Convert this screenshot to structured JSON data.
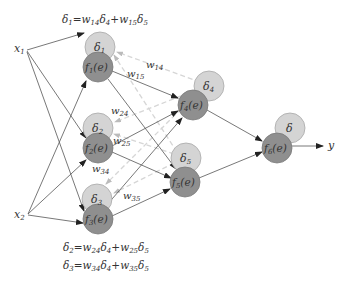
{
  "colors": {
    "delta_node_fill": "#d4d4d4",
    "delta_node_stroke": "#a8a8a8",
    "f_node_fill": "#8f8f8f",
    "f_node_stroke": "#7a7a7a",
    "forward_edge": "#555555",
    "backprop_edge": "#d6d6d6",
    "text": "#333333"
  },
  "inputs": [
    {
      "id": "x1",
      "label": "x",
      "sub": "1",
      "x": 22,
      "y": 49
    },
    {
      "id": "x2",
      "label": "x",
      "sub": "2",
      "x": 22,
      "y": 215
    }
  ],
  "output": {
    "label": "y",
    "x": 331,
    "y": 146
  },
  "nodes": [
    {
      "id": "n1",
      "delta": {
        "label": "δ",
        "sub": "1",
        "cx": 100,
        "cy": 47
      },
      "f": {
        "label": "f",
        "sub": "1",
        "arg": "(e)",
        "cx": 98,
        "cy": 67
      }
    },
    {
      "id": "n2",
      "delta": {
        "label": "δ",
        "sub": "2",
        "cx": 98,
        "cy": 128
      },
      "f": {
        "label": "f",
        "sub": "2",
        "arg": "(e)",
        "cx": 98,
        "cy": 148
      }
    },
    {
      "id": "n3",
      "delta": {
        "label": "δ",
        "sub": "3",
        "cx": 97,
        "cy": 199
      },
      "f": {
        "label": "f",
        "sub": "3",
        "arg": "(e)",
        "cx": 98,
        "cy": 219
      }
    },
    {
      "id": "n4",
      "delta": {
        "label": "δ",
        "sub": "4",
        "cx": 209,
        "cy": 86
      },
      "f": {
        "label": "f",
        "sub": "4",
        "arg": "(e)",
        "cx": 193,
        "cy": 105
      }
    },
    {
      "id": "n5",
      "delta": {
        "label": "δ",
        "sub": "5",
        "cx": 186,
        "cy": 157
      },
      "f": {
        "label": "f",
        "sub": "5",
        "arg": "(e)",
        "cx": 185,
        "cy": 182
      }
    },
    {
      "id": "n6",
      "delta": {
        "label": "δ",
        "sub": "",
        "cx": 290,
        "cy": 128
      },
      "f": {
        "label": "f",
        "sub": "6",
        "arg": "(e)",
        "cx": 277,
        "cy": 148
      }
    }
  ],
  "weights": [
    {
      "label": "w",
      "sub": "14",
      "x": 222,
      "y": 66
    },
    {
      "label": "w",
      "sub": "15",
      "x": 128,
      "y": 76
    },
    {
      "label": "w",
      "sub": "24",
      "x": 111,
      "y": 112
    },
    {
      "label": "w",
      "sub": "25",
      "x": 113,
      "y": 143
    },
    {
      "label": "w",
      "sub": "34",
      "x": 93,
      "y": 174
    },
    {
      "label": "w",
      "sub": "35",
      "x": 123,
      "y": 200
    }
  ],
  "formulas": {
    "top": {
      "lhs": "δ",
      "lhs_sub": "1",
      "t1_w": "w",
      "t1_w_sub": "14",
      "t1_d": "δ",
      "t1_d_sub": "4",
      "t2_w": "w",
      "t2_w_sub": "15",
      "t2_d": "δ",
      "t2_d_sub": "5"
    },
    "bottom1": {
      "lhs": "δ",
      "lhs_sub": "2",
      "t1_w": "w",
      "t1_w_sub": "24",
      "t1_d": "δ",
      "t1_d_sub": "4",
      "t2_w": "w",
      "t2_w_sub": "25",
      "t2_d": "δ",
      "t2_d_sub": "5"
    },
    "bottom2": {
      "lhs": "δ",
      "lhs_sub": "3",
      "t1_w": "w",
      "t1_w_sub": "34",
      "t1_d": "δ",
      "t1_d_sub": "4",
      "t2_w": "w",
      "t2_w_sub": "35",
      "t2_d": "δ",
      "t2_d_sub": "5"
    }
  }
}
